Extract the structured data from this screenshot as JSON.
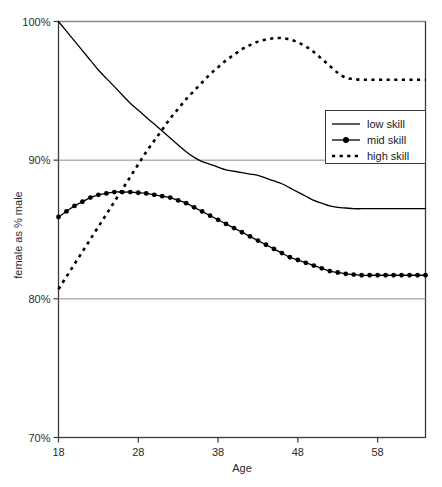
{
  "chart_data": {
    "type": "line",
    "title": "",
    "subtitle": "",
    "xlabel": "Age",
    "ylabel": "female as % male",
    "xlim": [
      18,
      64
    ],
    "ylim": [
      70,
      100
    ],
    "xticks": [
      18,
      28,
      38,
      48,
      58
    ],
    "xtick_labels": [
      "18",
      "28",
      "38",
      "48",
      "58"
    ],
    "yticks": [
      70,
      80,
      90,
      100
    ],
    "ytick_labels": [
      "70%",
      "80%",
      "90%",
      "100%"
    ],
    "grid": "horizontal",
    "legend_position": "center-right",
    "x": [
      18,
      19,
      20,
      21,
      22,
      23,
      24,
      25,
      26,
      27,
      28,
      29,
      30,
      31,
      32,
      33,
      34,
      35,
      36,
      37,
      38,
      39,
      40,
      41,
      42,
      43,
      44,
      45,
      46,
      47,
      48,
      49,
      50,
      51,
      52,
      53,
      54,
      55,
      56,
      57,
      58,
      59,
      60,
      61,
      62,
      63,
      64
    ],
    "series": [
      {
        "name": "low skill",
        "style": "solid",
        "marker": "none",
        "color": "#000000",
        "values": [
          100.0,
          99.3,
          98.6,
          97.9,
          97.2,
          96.5,
          95.9,
          95.3,
          94.7,
          94.1,
          93.6,
          93.1,
          92.6,
          92.1,
          91.6,
          91.1,
          90.6,
          90.2,
          89.9,
          89.7,
          89.5,
          89.3,
          89.2,
          89.1,
          89.0,
          88.9,
          88.7,
          88.5,
          88.3,
          88.0,
          87.7,
          87.4,
          87.1,
          86.9,
          86.7,
          86.6,
          86.55,
          86.5,
          86.5,
          86.5,
          86.5,
          86.5,
          86.5,
          86.5,
          86.5,
          86.5,
          86.5
        ]
      },
      {
        "name": "mid skill",
        "style": "solid",
        "marker": "filled-circle",
        "color": "#000000",
        "values": [
          85.9,
          86.3,
          86.7,
          87.0,
          87.3,
          87.5,
          87.6,
          87.7,
          87.7,
          87.7,
          87.65,
          87.6,
          87.5,
          87.4,
          87.3,
          87.1,
          86.9,
          86.6,
          86.3,
          86.0,
          85.7,
          85.4,
          85.1,
          84.8,
          84.5,
          84.2,
          83.9,
          83.6,
          83.3,
          83.0,
          82.8,
          82.6,
          82.4,
          82.2,
          82.0,
          81.9,
          81.8,
          81.75,
          81.7,
          81.7,
          81.7,
          81.7,
          81.7,
          81.7,
          81.7,
          81.7,
          81.7
        ]
      },
      {
        "name": "high skill",
        "style": "dashed",
        "marker": "none",
        "color": "#000000",
        "values": [
          80.7,
          81.6,
          82.5,
          83.4,
          84.3,
          85.2,
          86.1,
          87.0,
          87.9,
          88.8,
          89.7,
          90.6,
          91.4,
          92.2,
          93.0,
          93.7,
          94.4,
          95.0,
          95.6,
          96.2,
          96.7,
          97.2,
          97.6,
          98.0,
          98.3,
          98.55,
          98.7,
          98.8,
          98.8,
          98.7,
          98.5,
          98.2,
          97.8,
          97.3,
          96.8,
          96.3,
          95.95,
          95.85,
          95.8,
          95.8,
          95.8,
          95.8,
          95.8,
          95.8,
          95.8,
          95.8,
          95.8
        ]
      }
    ],
    "legend_entries": [
      "low skill",
      "mid skill",
      "high skill"
    ],
    "colors": {
      "axis": "#3a3a3a",
      "grid": "#8c8c8c",
      "series": "#000000",
      "background": "#ffffff"
    }
  }
}
